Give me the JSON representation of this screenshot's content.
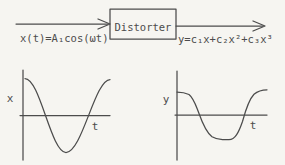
{
  "colors": {
    "ink": "#4c4c4c",
    "background": "#f6f5f1"
  },
  "block_diagram": {
    "box_label": "Distorter",
    "input_formula": "x(t)=A₁cos(ωt)",
    "output_formula": "y=c₁x+c₂x²+c₃x³"
  },
  "input_plot": {
    "y_axis_label": "x",
    "x_axis_label": "t"
  },
  "output_plot": {
    "y_axis_label": "y",
    "x_axis_label": "t"
  }
}
